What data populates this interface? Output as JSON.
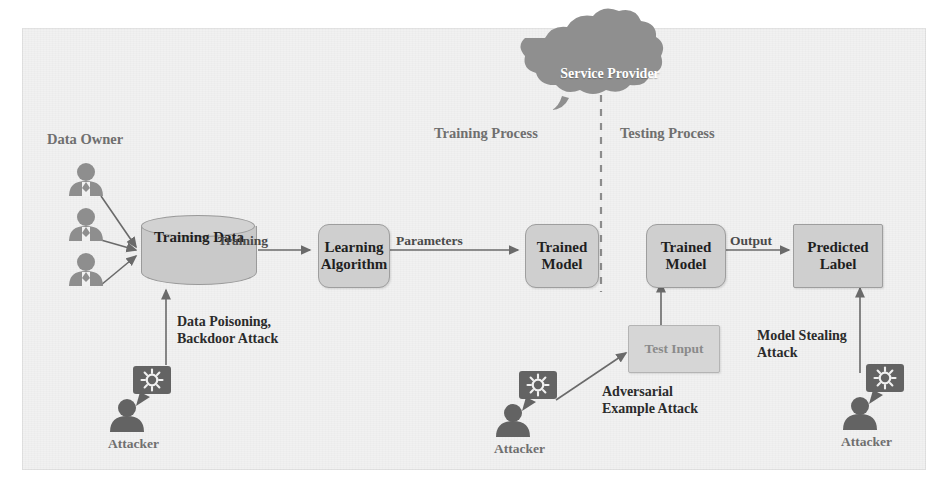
{
  "diagram": {
    "background_color": "#f1f1f1",
    "node_fill": "#cfcfcf",
    "node_stroke": "#9e9e9e",
    "cloud_fill": "#8f8f8f",
    "text_color": "#1f1f1f",
    "label_color": "#6f6f6f"
  },
  "phases": {
    "training": "Training Process",
    "testing": "Testing Process"
  },
  "cloud": {
    "label": "Service\nProvider"
  },
  "actors": {
    "data_owner": "Data Owner",
    "attacker": "Attacker"
  },
  "nodes": {
    "training_data": "Training\nData",
    "learning_algorithm": "Learning\nAlgorithm",
    "trained_model_left": "Trained\nModel",
    "trained_model_right": "Trained\nModel",
    "predicted_label": "Predicted\nLabel",
    "test_input": "Test Input"
  },
  "edges": {
    "training": "Training",
    "parameters": "Parameters",
    "output": "Output"
  },
  "attacks": {
    "data_poisoning": "Data Poisoning,\nBackdoor Attack",
    "adversarial_example": "Adversarial\nExample Attack",
    "model_stealing": "Model Stealing\nAttack"
  }
}
